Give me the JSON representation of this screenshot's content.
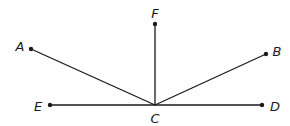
{
  "diagram": {
    "title": "",
    "stroke_color": "#1a1a1a",
    "points": {
      "A": {
        "label": "A",
        "x": 31,
        "y": 49,
        "label_x": 20,
        "label_y": 46
      },
      "B": {
        "label": "B",
        "x": 266,
        "y": 54,
        "label_x": 277,
        "label_y": 51
      },
      "C": {
        "label": "C",
        "x": 155,
        "y": 105,
        "label_x": 155,
        "label_y": 118
      },
      "D": {
        "label": "D",
        "x": 262,
        "y": 105,
        "label_x": 275,
        "label_y": 106
      },
      "E": {
        "label": "E",
        "x": 50,
        "y": 105,
        "label_x": 38,
        "label_y": 106
      },
      "F": {
        "label": "F",
        "x": 155,
        "y": 24,
        "label_x": 155,
        "label_y": 13
      }
    },
    "segments": [
      {
        "from": "C",
        "to": "A"
      },
      {
        "from": "C",
        "to": "F"
      },
      {
        "from": "C",
        "to": "B"
      },
      {
        "from": "C",
        "to": "E"
      },
      {
        "from": "C",
        "to": "D"
      }
    ]
  }
}
